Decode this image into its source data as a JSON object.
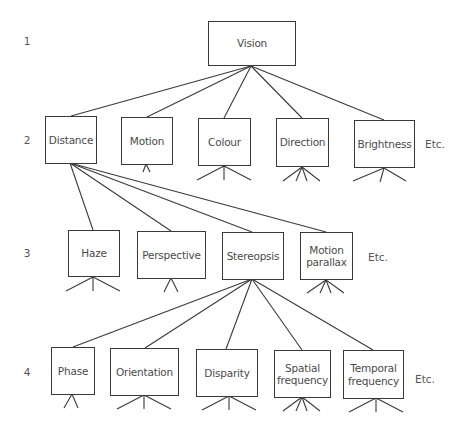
{
  "diagram": {
    "type": "hierarchy-tree",
    "levels": [
      {
        "number": "1",
        "y": 41
      },
      {
        "number": "2",
        "y": 140
      },
      {
        "number": "3",
        "y": 253
      },
      {
        "number": "4",
        "y": 372
      }
    ],
    "nodes": {
      "vision": {
        "label": "Vision",
        "level": 1
      },
      "distance": {
        "label": "Distance",
        "level": 2
      },
      "motion": {
        "label": "Motion",
        "level": 2
      },
      "colour": {
        "label": "Colour",
        "level": 2
      },
      "direction": {
        "label": "Direction",
        "level": 2
      },
      "brightness": {
        "label": "Brightness",
        "level": 2
      },
      "haze": {
        "label": "Haze",
        "level": 3
      },
      "perspective": {
        "label": "Perspective",
        "level": 3
      },
      "stereopsis": {
        "label": "Stereopsis",
        "level": 3
      },
      "motion_parallax": {
        "label": "Motion\nparallax",
        "level": 3
      },
      "phase": {
        "label": "Phase",
        "level": 4
      },
      "orientation": {
        "label": "Orientation",
        "level": 4
      },
      "disparity": {
        "label": "Disparity",
        "level": 4
      },
      "spatial_frequency": {
        "label": "Spatial\nfrequency",
        "level": 4
      },
      "temporal_frequency": {
        "label": "Temporal\nfrequency",
        "level": 4
      }
    },
    "edges": [
      [
        "vision",
        "distance"
      ],
      [
        "vision",
        "motion"
      ],
      [
        "vision",
        "colour"
      ],
      [
        "vision",
        "direction"
      ],
      [
        "vision",
        "brightness"
      ],
      [
        "distance",
        "haze"
      ],
      [
        "distance",
        "perspective"
      ],
      [
        "distance",
        "stereopsis"
      ],
      [
        "distance",
        "motion_parallax"
      ],
      [
        "stereopsis",
        "phase"
      ],
      [
        "stereopsis",
        "orientation"
      ],
      [
        "stereopsis",
        "disparity"
      ],
      [
        "stereopsis",
        "spatial_frequency"
      ],
      [
        "stereopsis",
        "temporal_frequency"
      ]
    ],
    "etc_labels": {
      "level2": "Etc.",
      "level3": "Etc.",
      "level4": "Etc."
    }
  }
}
